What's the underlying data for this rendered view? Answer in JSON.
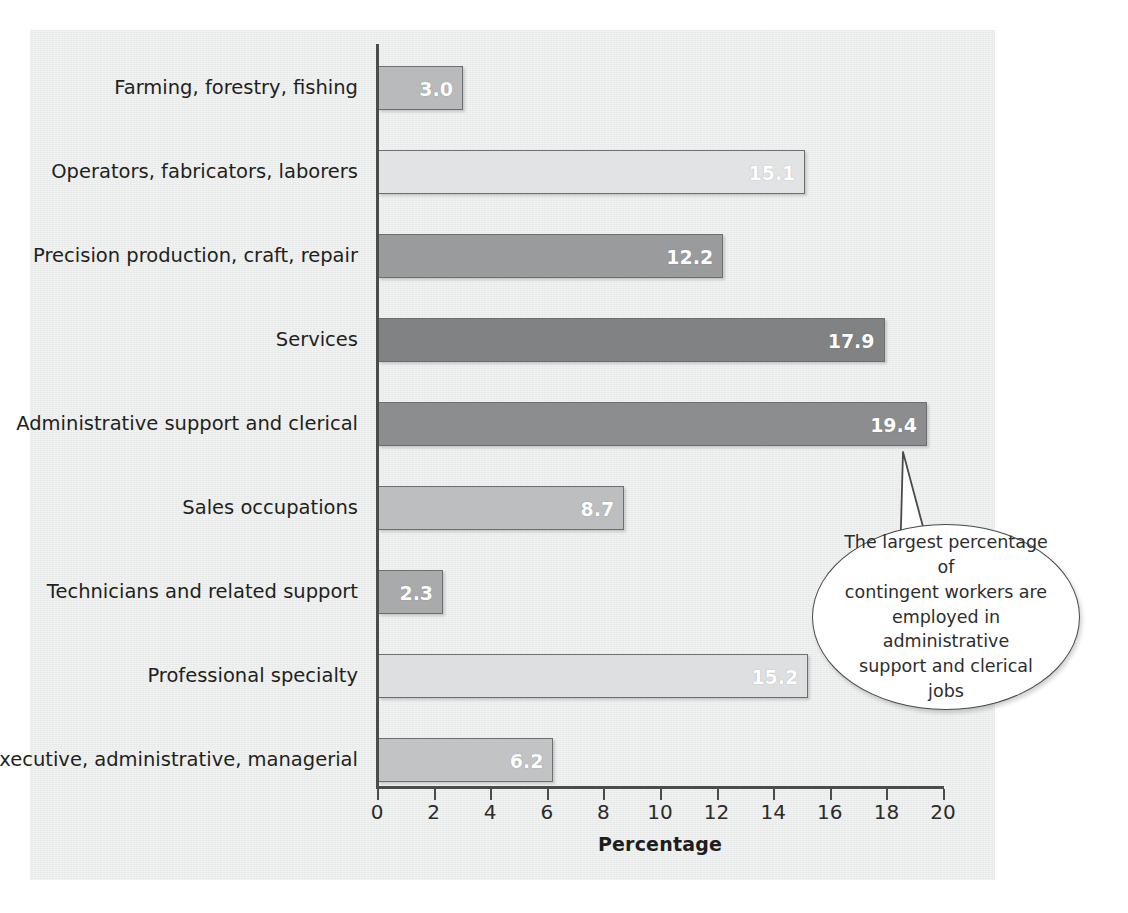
{
  "chart_data": {
    "type": "bar",
    "orientation": "horizontal",
    "title": "",
    "xlabel": "Percentage",
    "ylabel": "",
    "xlim": [
      0,
      20
    ],
    "xticks": [
      0,
      2,
      4,
      6,
      8,
      10,
      12,
      14,
      16,
      18,
      20
    ],
    "xtick_labels": [
      "0",
      "2",
      "4",
      "6",
      "8",
      "10",
      "12",
      "14",
      "16",
      "18",
      "20"
    ],
    "grid": false,
    "legend": "none",
    "categories": [
      "Farming, forestry, fishing",
      "Operators, fabricators, laborers",
      "Precision production, craft, repair",
      "Services",
      "Administrative support and clerical",
      "Sales occupations",
      "Technicians and related support",
      "Professional specialty",
      "Executive, administrative, managerial"
    ],
    "values": [
      3.0,
      15.1,
      12.2,
      17.9,
      19.4,
      8.7,
      2.3,
      15.2,
      6.2
    ],
    "value_labels": [
      "3.0",
      "15.1",
      "12.2",
      "17.9",
      "19.4",
      "8.7",
      "2.3",
      "15.2",
      "6.2"
    ],
    "bar_colors": [
      "#b9babb",
      "#e2e3e4",
      "#9a9b9c",
      "#818283",
      "#8c8d8e",
      "#bdbebf",
      "#a9aaab",
      "#dedfe0",
      "#c2c3c4"
    ],
    "annotations": [
      {
        "name": "largest-percentage-callout",
        "text": "The largest percentage of contingent workers are employed in administrative support and clerical jobs",
        "lines": [
          "The largest percentage of",
          "contingent workers are",
          "employed in administrative",
          "support and clerical jobs"
        ],
        "points_to_category": "Administrative support and clerical"
      }
    ]
  },
  "style": {
    "panel_background": "#eceeed",
    "page_background": "#ffffff",
    "axis_color": "#4b4b4b",
    "bar_border": "#6d6d6d",
    "value_label_color": "#ffffff",
    "text_color": "#231f20",
    "callout_fill": "#ffffff",
    "callout_stroke": "#4a4a4a"
  }
}
